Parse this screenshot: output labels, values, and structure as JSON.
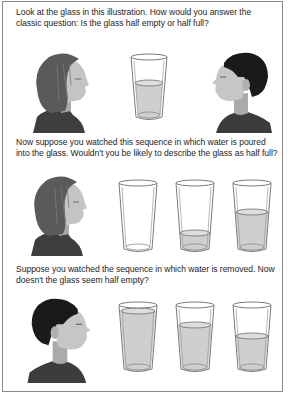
{
  "document": {
    "paragraphs": [
      "Look at the glass in this illustration. How would you answer the classic question:  Is the glass half empty or half full?",
      "Now suppose you watched this sequence in which water is poured into the glass. Wouldn't you be likely to describe the glass as half full?",
      "Suppose you watched the sequence in which water is removed. Now doesn't the glass seem half empty?"
    ],
    "rows": [
      {
        "figures": [
          "woman-profile-facing-right",
          "glass-half",
          "man-profile-facing-left"
        ],
        "glass_fill_levels": [
          0.5
        ]
      },
      {
        "figures": [
          "woman-profile-facing-right",
          "glass-empty",
          "glass-quarter",
          "glass-half"
        ],
        "glass_fill_levels": [
          0.0,
          0.25,
          0.55
        ]
      },
      {
        "figures": [
          "man-profile-facing-right",
          "glass-full",
          "glass-three-quarter",
          "glass-half"
        ],
        "glass_fill_levels": [
          0.93,
          0.72,
          0.55
        ]
      }
    ],
    "colors": {
      "border": "#8a8a8a",
      "text": "#1e1e1e",
      "water": "#cfcfcf",
      "glass_outline": "#7a7a7a",
      "hair_woman": "#5a5a5a",
      "hair_man": "#1a1a1a",
      "skin": "#bdbdbd",
      "shirt": "#3c3c3c"
    }
  }
}
